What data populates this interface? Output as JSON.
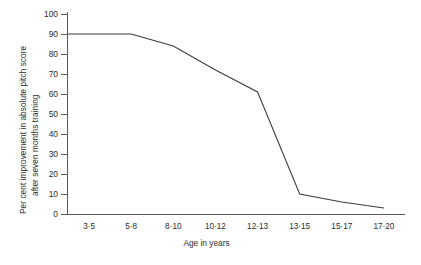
{
  "chart_data": {
    "type": "line",
    "title": "",
    "xlabel": "Age in years",
    "ylabel_line1": "Per cent improvement in absolute pitch score",
    "ylabel_line2": "after seven months training",
    "categories": [
      "3·5",
      "5·8",
      "8·10",
      "10·12",
      "12·13",
      "13·15",
      "15·17",
      "17·20"
    ],
    "values": [
      90,
      90,
      84,
      72,
      61,
      10,
      6,
      3
    ],
    "x": [
      1,
      2,
      3,
      4,
      5,
      6,
      7,
      8
    ],
    "ylim": [
      0,
      100
    ],
    "ytick_values": [
      0,
      10,
      20,
      30,
      40,
      50,
      60,
      70,
      80,
      90,
      100
    ],
    "ytick_labels": [
      "0",
      "10",
      "20",
      "30",
      "40",
      "50",
      "60",
      "70",
      "80",
      "90",
      "100"
    ],
    "grid": false,
    "legend": "none",
    "series": [
      {
        "name": "Per cent improvement in absolute pitch score after seven months training",
        "values": [
          90,
          90,
          84,
          72,
          61,
          10,
          6,
          3
        ]
      }
    ],
    "line_color": "#3b3b3b",
    "axis_color": "#5a5a5a",
    "background_color": "#ffffff",
    "vertices_note": "Line begins at the y-axis at 90, remains flat to the 3·5 interval, then declines progressively, falling steeply after 12·13 to about 10 at 13·15 and tapering to about 3 at 17·20."
  }
}
